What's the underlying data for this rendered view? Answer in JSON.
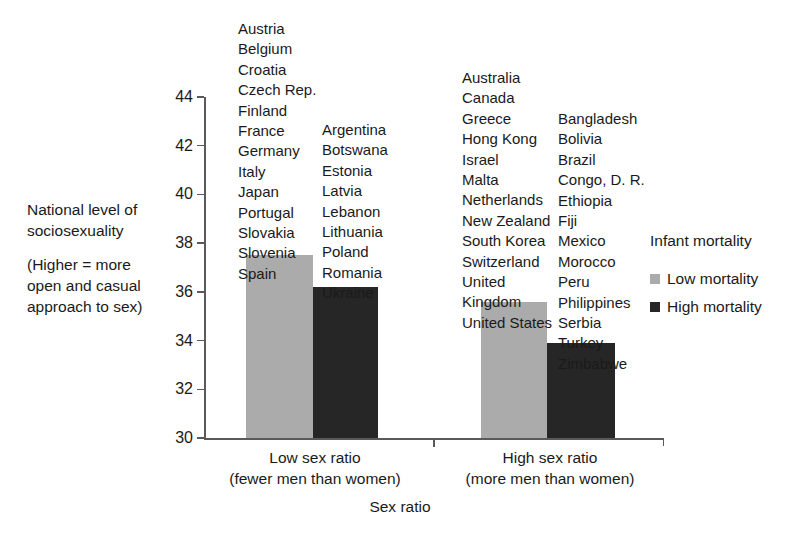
{
  "chart_data": {
    "type": "bar",
    "title": "",
    "xlabel": "Sex ratio",
    "ylabel": "National level of sociosexuality",
    "ylabel_note": "(Higher = more open and casual approach to sex)",
    "ylim": [
      30,
      44
    ],
    "yticks": [
      44,
      42,
      40,
      38,
      36,
      34,
      32,
      30
    ],
    "grid": false,
    "legend_position": "right",
    "legend_title": "Infant mortality",
    "categories": [
      "Low sex ratio",
      "High sex ratio"
    ],
    "category_sublabels": [
      "(fewer men than women)",
      "(more men than women)"
    ],
    "series": [
      {
        "name": "Low mortality",
        "color": "#ababab",
        "values": [
          37.5,
          35.6
        ]
      },
      {
        "name": "High mortality",
        "color": "#262626",
        "values": [
          36.2,
          33.9
        ]
      }
    ],
    "annotations": {
      "low_sex_ratio_low_mortality_countries": [
        "Austria",
        "Belgium",
        "Croatia",
        "Czech Rep.",
        "Finland",
        "France",
        "Germany",
        "Italy",
        "Japan",
        "Portugal",
        "Slovakia",
        "Slovenia",
        "Spain"
      ],
      "low_sex_ratio_high_mortality_countries": [
        "Argentina",
        "Botswana",
        "Estonia",
        "Latvia",
        "Lebanon",
        "Lithuania",
        "Poland",
        "Romania",
        "Ukraine"
      ],
      "high_sex_ratio_low_mortality_countries": [
        "Australia",
        "Canada",
        "Greece",
        "Hong Kong",
        "Israel",
        "Malta",
        "Netherlands",
        "New Zealand",
        "South Korea",
        "Switzerland",
        "United Kingdom",
        "United States"
      ],
      "high_sex_ratio_high_mortality_countries": [
        "Bangladesh",
        "Bolivia",
        "Brazil",
        "Congo, D. R.",
        "Ethiopia",
        "Fiji",
        "Mexico",
        "Morocco",
        "Peru",
        "Philippines",
        "Serbia",
        "Turkey",
        "Zimbabwe"
      ]
    }
  },
  "axis": {
    "y_title_line_1": "National level of",
    "y_title_line_2": "sociosexuality",
    "y_note_line_1": "(Higher = more",
    "y_note_line_2": "open and casual",
    "y_note_line_3": "approach to sex)",
    "y_tick_labels": [
      "44",
      "42",
      "40",
      "38",
      "36",
      "34",
      "32",
      "30"
    ],
    "x_title": "Sex ratio",
    "x_group_0_line_1": "Low sex ratio",
    "x_group_0_line_2": "(fewer men than women)",
    "x_group_1_line_1": "High sex ratio",
    "x_group_1_line_2": "(more men than women)"
  },
  "legend": {
    "title": "Infant mortality",
    "items": [
      {
        "label": "Low mortality",
        "color": "#ababab"
      },
      {
        "label": "High mortality",
        "color": "#262626"
      }
    ]
  },
  "country_lists": {
    "list_0": "Austria\nBelgium\nCroatia\nCzech Rep.\nFinland\nFrance\nGermany\nItaly\nJapan\nPortugal\nSlovakia\nSlovenia\nSpain",
    "list_1": "Argentina\nBotswana\nEstonia\nLatvia\nLebanon\nLithuania\nPoland\nRomania\nUkraine",
    "list_2": "Australia\nCanada\nGreece\nHong Kong\nIsrael\nMalta\nNetherlands\nNew Zealand\nSouth Korea\nSwitzerland\nUnited Kingdom\nUnited States",
    "list_3": "Bangladesh\nBolivia\nBrazil\nCongo, D. R.\nEthiopia\nFiji\nMexico\nMorocco\nPeru\nPhilippines\nSerbia\nTurkey\nZimbabwe"
  }
}
